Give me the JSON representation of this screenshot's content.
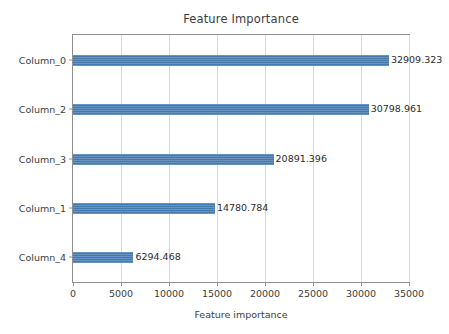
{
  "chart_data": {
    "type": "bar",
    "orientation": "horizontal",
    "title": "Feature Importance",
    "xlabel": "Feature importance",
    "ylabel": "",
    "categories": [
      "Column_0",
      "Column_2",
      "Column_3",
      "Column_1",
      "Column_4"
    ],
    "values": [
      32909.323,
      30798.961,
      20891.396,
      14780.784,
      6294.468
    ],
    "data_labels": [
      "32909.323",
      "30798.961",
      "20891.396",
      "14780.784",
      "6294.468"
    ],
    "xlim": [
      0,
      35000
    ],
    "xticks": [
      0,
      5000,
      10000,
      15000,
      20000,
      25000,
      30000,
      35000
    ],
    "xtick_labels": [
      "0",
      "5000",
      "10000",
      "15000",
      "20000",
      "25000",
      "30000",
      "35000"
    ],
    "grid": "vertical",
    "legend": null,
    "bar_color": "#4a7fb5",
    "background_color": "#ffffff",
    "axis_color": "#8f8f8f",
    "gridline_color": "#d9d9d9",
    "series": [
      {
        "name": "Feature importance",
        "values": [
          32909.323,
          30798.961,
          20891.396,
          14780.784,
          6294.468
        ]
      }
    ]
  }
}
